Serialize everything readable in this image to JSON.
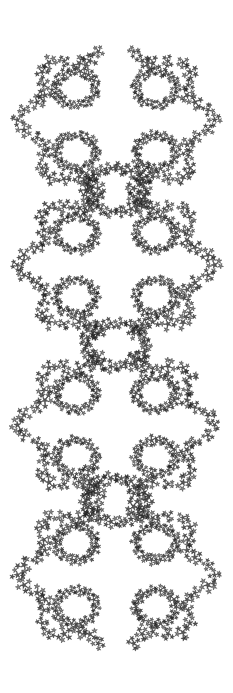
{
  "image": {
    "description": "Vertical fractal pattern of clustered star motifs forming interlocking rings",
    "background": "#ffffff",
    "ink": "#2e2e2e",
    "ink_light": "#6a6a6a"
  },
  "fractal": {
    "column_x": 116,
    "rings": [
      {
        "cx": 116,
        "cy": 120,
        "r": 88
      },
      {
        "cx": 116,
        "cy": 265,
        "r": 88
      },
      {
        "cx": 116,
        "cy": 425,
        "r": 88
      },
      {
        "cx": 116,
        "cy": 575,
        "r": 88
      }
    ],
    "lobes_per_ring": 8,
    "star_points": 5
  }
}
